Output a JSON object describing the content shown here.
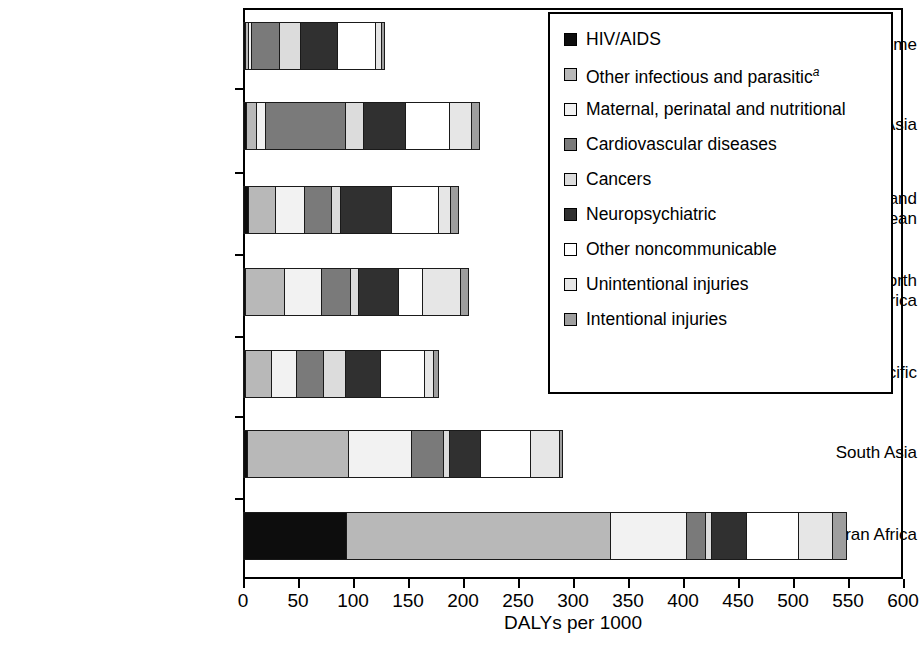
{
  "chart_data": {
    "type": "bar",
    "orientation": "horizontal",
    "stacked": true,
    "title": "",
    "xlabel": "DALYs per 1000",
    "ylabel": "",
    "xlim": [
      0,
      600
    ],
    "xticks": [
      0,
      50,
      100,
      150,
      200,
      250,
      300,
      350,
      400,
      450,
      500,
      550,
      600
    ],
    "grid": false,
    "legend_position": "upper right",
    "categories": [
      "High income",
      "Europe and Central Asia",
      "Latin America and Caribbean",
      "Middle East and North Africa",
      "East Asia and Pacific",
      "South Asia",
      "Sub-Saharan Africa"
    ],
    "series": [
      {
        "name": "HIV/AIDS",
        "color": "#0d0d0d",
        "values": [
          1,
          2,
          4,
          1,
          1,
          3,
          93
        ]
      },
      {
        "name": "Other infectious and parasitic",
        "color": "#b8b8b8",
        "values": [
          3,
          9,
          24,
          35,
          24,
          92,
          240
        ]
      },
      {
        "name": "Maternal, perinatal and nutritional",
        "color": "#f2f2f2",
        "values": [
          2,
          8,
          27,
          34,
          22,
          57,
          69
        ]
      },
      {
        "name": "Cardiovascular diseases",
        "color": "#7a7a7a",
        "values": [
          26,
          73,
          24,
          26,
          25,
          29,
          17
        ]
      },
      {
        "name": "Cancers",
        "color": "#dcdcdc",
        "values": [
          19,
          16,
          8,
          8,
          20,
          5,
          6
        ]
      },
      {
        "name": "Neuropsychiatric",
        "color": "#303030",
        "values": [
          34,
          38,
          47,
          36,
          32,
          29,
          31
        ]
      },
      {
        "name": "Other noncommunicable",
        "color": "#ffffff",
        "values": [
          34,
          40,
          42,
          22,
          40,
          45,
          48
        ]
      },
      {
        "name": "Unintentional injuries",
        "color": "#e6e6e6",
        "values": [
          6,
          20,
          11,
          34,
          8,
          26,
          31
        ]
      },
      {
        "name": "Intentional injuries",
        "color": "#9e9e9e",
        "values": [
          2,
          8,
          8,
          8,
          4,
          3,
          12
        ]
      }
    ],
    "totals": [
      127,
      214,
      195,
      204,
      176,
      289,
      547
    ],
    "legend_footnote_marker": "a"
  },
  "legend": {
    "items": [
      {
        "label": "HIV/AIDS",
        "sup": ""
      },
      {
        "label": "Other infectious and parasitic",
        "sup": "a"
      },
      {
        "label": "Maternal, perinatal and nutritional",
        "sup": ""
      },
      {
        "label": "Cardiovascular diseases",
        "sup": ""
      },
      {
        "label": "Cancers",
        "sup": ""
      },
      {
        "label": "Neuropsychiatric",
        "sup": ""
      },
      {
        "label": "Other noncommunicable",
        "sup": ""
      },
      {
        "label": "Unintentional injuries",
        "sup": ""
      },
      {
        "label": "Intentional injuries",
        "sup": ""
      }
    ]
  }
}
